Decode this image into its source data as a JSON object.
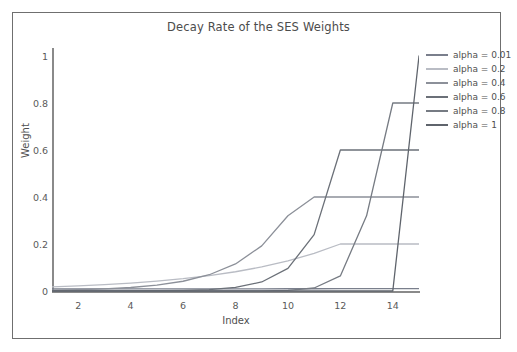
{
  "chart_data": {
    "type": "line",
    "title": "Decay Rate of the SES Weights",
    "xlabel": "Index",
    "ylabel": "Weight",
    "xlim": [
      1,
      15
    ],
    "ylim": [
      0,
      1.05
    ],
    "grid": false,
    "legend_position": "top-right",
    "xticks": [
      "2",
      "4",
      "6",
      "8",
      "10",
      "12",
      "14"
    ],
    "xtick_values": [
      2,
      4,
      6,
      8,
      10,
      12,
      14
    ],
    "yticks": [
      "0",
      "0.2",
      "0.4",
      "0.6",
      "0.8",
      "1"
    ],
    "ytick_values": [
      0,
      0.2,
      0.4,
      0.6,
      0.8,
      1
    ],
    "x": [
      1,
      2,
      3,
      4,
      5,
      6,
      7,
      8,
      9,
      10,
      11,
      12,
      13,
      14,
      15
    ],
    "series": [
      {
        "name": "alpha = 0.01",
        "alpha": 0.01,
        "color": "#7a7f8c",
        "values": [
          0.0087,
          0.0088,
          0.0089,
          0.009,
          0.0091,
          0.0092,
          0.0092,
          0.0093,
          0.0094,
          0.0095,
          0.0096,
          0.0097,
          0.0098,
          0.0099,
          0.01
        ]
      },
      {
        "name": "alpha = 0.2",
        "alpha": 0.2,
        "color": "#b9bcc4",
        "values": [
          0.0172,
          0.0215,
          0.0268,
          0.0336,
          0.0419,
          0.0524,
          0.0655,
          0.0819,
          0.1024,
          0.128,
          0.16,
          0.2,
          0.2,
          0.2,
          0.2
        ]
      },
      {
        "name": "alpha = 0.4",
        "alpha": 0.4,
        "color": "#8c9099",
        "values": [
          0.0032,
          0.0054,
          0.009,
          0.015,
          0.025,
          0.0415,
          0.0692,
          0.1152,
          0.192,
          0.32,
          0.4,
          0.4,
          0.4,
          0.4,
          0.4
        ]
      },
      {
        "name": "alpha = 0.6",
        "alpha": 0.6,
        "color": "#6b7078",
        "values": [
          2e-05,
          6e-05,
          0.00015,
          0.00038,
          0.00096,
          0.0024,
          0.0061,
          0.0154,
          0.0384,
          0.096,
          0.24,
          0.6,
          0.6,
          0.6,
          0.6
        ]
      },
      {
        "name": "alpha = 0.8",
        "alpha": 0.8,
        "color": "#767b83",
        "values": [
          0.0,
          0.0,
          0.0,
          0.0,
          0.0,
          0.0,
          2e-05,
          0.0001,
          0.0005,
          0.0026,
          0.0128,
          0.064,
          0.32,
          0.8,
          0.8
        ]
      },
      {
        "name": "alpha = 1",
        "alpha": 1,
        "color": "#5f646c",
        "values": [
          0,
          0,
          0,
          0,
          0,
          0,
          0,
          0,
          0,
          0,
          0,
          0,
          0,
          0,
          1
        ]
      }
    ]
  },
  "legend": {
    "items": [
      {
        "label": "alpha = 0.01",
        "color": "#7a7f8c"
      },
      {
        "label": "alpha = 0.2",
        "color": "#b9bcc4"
      },
      {
        "label": "alpha = 0.4",
        "color": "#8c9099"
      },
      {
        "label": "alpha = 0.6",
        "color": "#6b7078"
      },
      {
        "label": "alpha = 0.8",
        "color": "#767b83"
      },
      {
        "label": "alpha = 1",
        "color": "#5f646c"
      }
    ]
  },
  "axes": {
    "axis_color": "#8a8a8a",
    "frame_color": "#6f6f6f",
    "text_color": "#4f4f4f"
  }
}
